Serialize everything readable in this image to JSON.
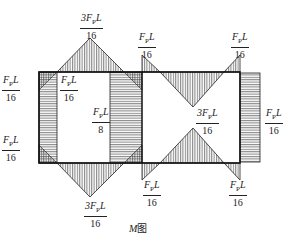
{
  "diagram": {
    "title": "M图",
    "caption_italic": "M",
    "caption_rest": "图",
    "labels": [
      {
        "id": "top-left-apex",
        "num_coef": "3",
        "num_var": "F",
        "num_sub": "P",
        "num_tail": "L",
        "den": "16"
      },
      {
        "id": "left-outer-top",
        "num_coef": "",
        "num_var": "F",
        "num_sub": "P",
        "num_tail": "L",
        "den": "16"
      },
      {
        "id": "left-inner-top",
        "num_coef": "",
        "num_var": "F",
        "num_sub": "P",
        "num_tail": "L",
        "den": "16"
      },
      {
        "id": "middle-strip",
        "num_coef": "",
        "num_var": "F",
        "num_sub": "P",
        "num_tail": "L",
        "den": "8"
      },
      {
        "id": "left-outer-bottom",
        "num_coef": "",
        "num_var": "F",
        "num_sub": "P",
        "num_tail": "L",
        "den": "16"
      },
      {
        "id": "bottom-left-apex",
        "num_coef": "3",
        "num_var": "F",
        "num_sub": "P",
        "num_tail": "L",
        "den": "16"
      },
      {
        "id": "right-top-left",
        "num_coef": "",
        "num_var": "F",
        "num_sub": "P",
        "num_tail": "L",
        "den": "16"
      },
      {
        "id": "right-top-right",
        "num_coef": "",
        "num_var": "F",
        "num_sub": "P",
        "num_tail": "L",
        "den": "16"
      },
      {
        "id": "right-center",
        "num_coef": "3",
        "num_var": "F",
        "num_sub": "P",
        "num_tail": "L",
        "den": "16"
      },
      {
        "id": "right-side",
        "num_coef": "",
        "num_var": "F",
        "num_sub": "P",
        "num_tail": "L",
        "den": "16"
      },
      {
        "id": "right-bottom-left",
        "num_coef": "",
        "num_var": "F",
        "num_sub": "P",
        "num_tail": "L",
        "den": "16"
      },
      {
        "id": "right-bottom-right",
        "num_coef": "",
        "num_var": "F",
        "num_sub": "P",
        "num_tail": "L",
        "den": "16"
      }
    ],
    "colors": {
      "line": "#222222",
      "hatch": "#333333",
      "background": "#ffffff"
    }
  }
}
